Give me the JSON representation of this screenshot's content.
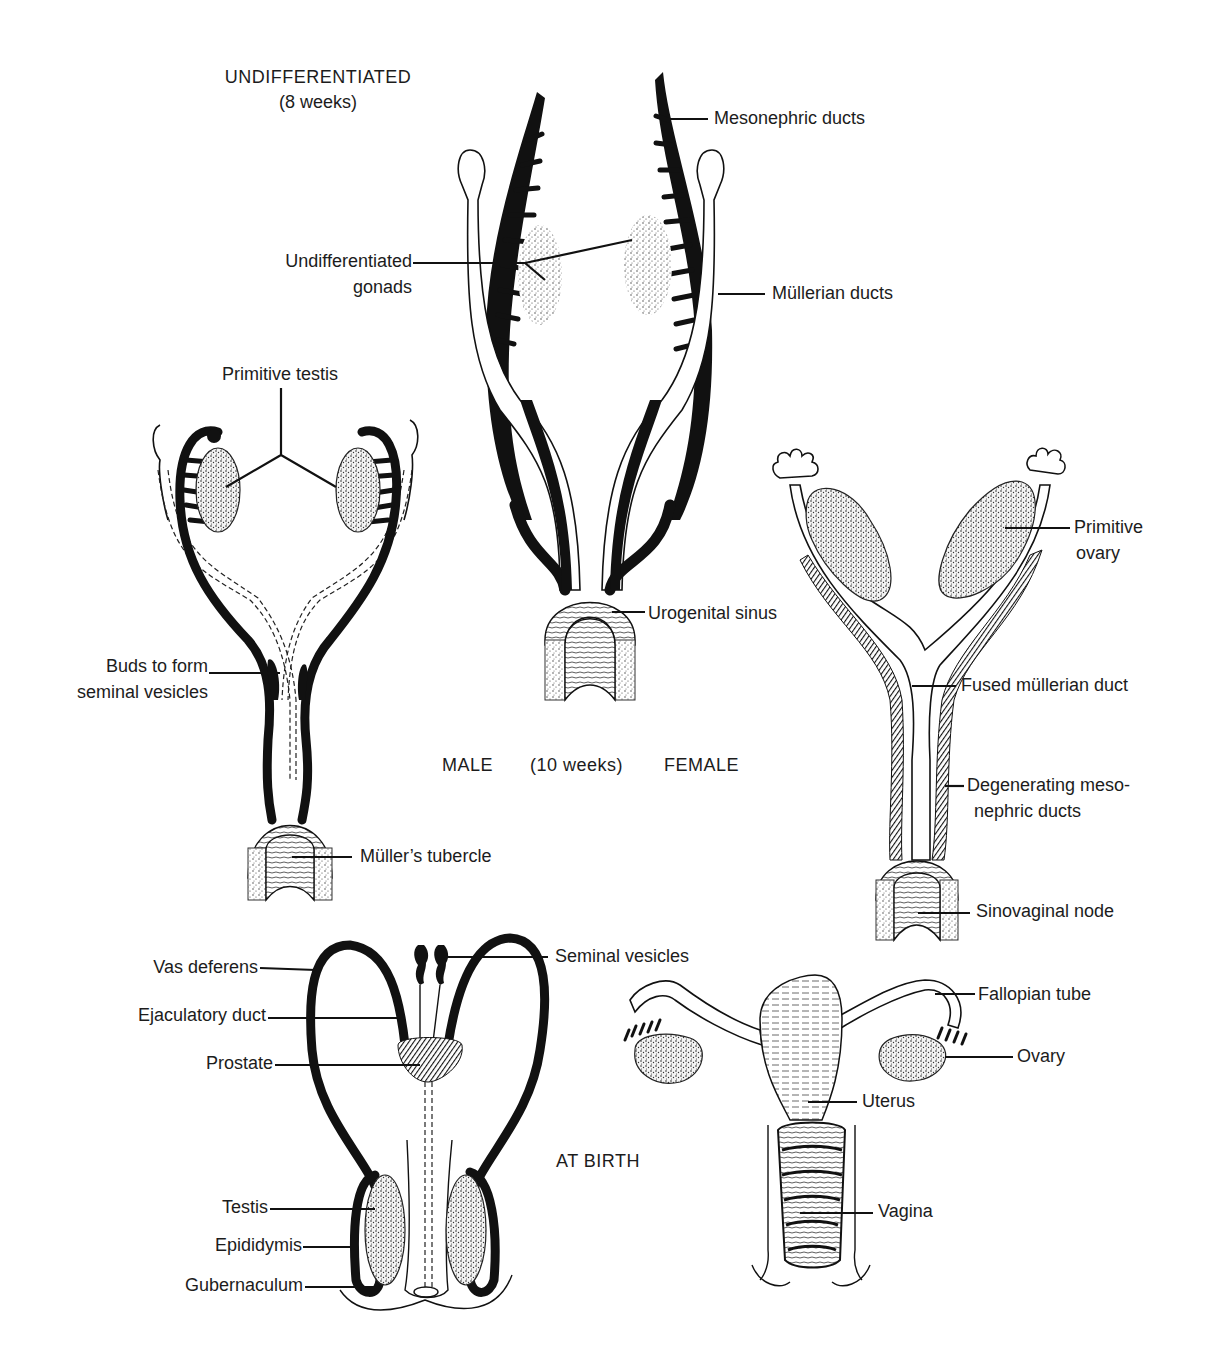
{
  "figure": {
    "panels": {
      "undifferentiated": {
        "title": "UNDIFFERENTIATED",
        "subtitle": "(8 weeks)",
        "labels": {
          "mesonephric_ducts": "Mesonephric ducts",
          "undiff_gonads_line1": "Undifferentiated",
          "undiff_gonads_line2": "gonads",
          "mullerian_ducts": "Müllerian ducts",
          "urogenital_sinus": "Urogenital sinus"
        }
      },
      "ten_weeks": {
        "male_label": "MALE",
        "age_label": "(10 weeks)",
        "female_label": "FEMALE",
        "male_labels": {
          "primitive_testis": "Primitive testis",
          "buds_line1": "Buds to form",
          "buds_line2": "seminal vesicles",
          "mullers_tubercle": "Müller’s tubercle"
        },
        "female_labels": {
          "primitive_ovary_line1": "Primitive",
          "primitive_ovary_line2": "ovary",
          "fused_mullerian_duct": "Fused müllerian duct",
          "degenerating_line1": "Degenerating meso-",
          "degenerating_line2": "nephric ducts",
          "sinovaginal_node": "Sinovaginal node"
        }
      },
      "at_birth": {
        "title": "AT BIRTH",
        "male_labels": {
          "vas_deferens": "Vas deferens",
          "seminal_vesicles": "Seminal vesicles",
          "ejaculatory_duct": "Ejaculatory duct",
          "prostate": "Prostate",
          "testis": "Testis",
          "epididymis": "Epididymis",
          "gubernaculum": "Gubernaculum"
        },
        "female_labels": {
          "fallopian_tube": "Fallopian tube",
          "ovary": "Ovary",
          "uterus": "Uterus",
          "vagina": "Vagina"
        }
      }
    },
    "colors": {
      "ink": "#111111",
      "background": "#ffffff"
    }
  }
}
